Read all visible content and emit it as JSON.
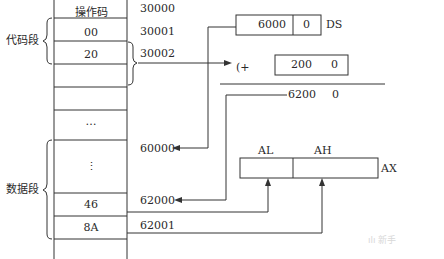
{
  "memory": {
    "cells": [
      {
        "label": "操作码",
        "address": "30000"
      },
      {
        "label": "00",
        "address": "30001"
      },
      {
        "label": "20",
        "address": "30002"
      },
      {
        "label": "",
        "address": ""
      },
      {
        "label": "…",
        "address": ""
      },
      {
        "label": "",
        "address": "60000"
      },
      {
        "label": "⋮",
        "address": ""
      },
      {
        "label": "46",
        "address": "62000"
      },
      {
        "label": "8A",
        "address": "62001"
      }
    ],
    "segments": {
      "code": "代码段",
      "data": "数据段"
    }
  },
  "address_calc": {
    "ds_value": "6000",
    "ds_shift": "0",
    "ds_label": "DS",
    "plus": "(+",
    "offset_value": "200",
    "offset_shift": "0",
    "result_value": "6200",
    "result_shift": "0"
  },
  "register": {
    "name": "AX",
    "low": "AL",
    "high": "AH"
  },
  "watermark": "ılı 新手"
}
